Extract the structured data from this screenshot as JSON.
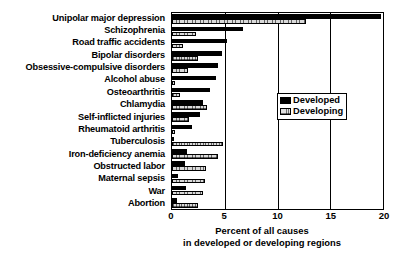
{
  "chart_data": {
    "type": "bar",
    "orientation": "horizontal",
    "title": "",
    "xlabel_line1": "Percent of all causes",
    "xlabel_line2": "in developed or developing regions",
    "ylabel": "",
    "xlim": [
      0,
      20
    ],
    "xticks": [
      0,
      5,
      10,
      15,
      20
    ],
    "grid": true,
    "legend_position": "right",
    "categories": [
      "Unipolar major depression",
      "Schizophrenia",
      "Road traffic accidents",
      "Bipolar disorders",
      "Obsessive-compulsive disorders",
      "Alcohol abuse",
      "Osteoarthritis",
      "Chlamydia",
      "Self-inflicted injuries",
      "Rheumatoid arthritis",
      "Tuberculosis",
      "Iron-deficiency anemia",
      "Obstructed labor",
      "Maternal sepsis",
      "War",
      "Abortion"
    ],
    "series": [
      {
        "name": "Developed",
        "color": "#000000",
        "values": [
          19.8,
          6.7,
          5.2,
          4.7,
          4.4,
          4.2,
          3.6,
          2.9,
          2.7,
          1.9,
          0.2,
          1.4,
          1.2,
          0.6,
          1.3,
          0.5
        ]
      },
      {
        "name": "Developing",
        "color": "#d9d9d9",
        "values": [
          12.7,
          2.3,
          1.0,
          2.5,
          1.5,
          0.3,
          0.8,
          3.3,
          1.6,
          0.3,
          4.8,
          4.4,
          3.2,
          3.1,
          2.9,
          2.5
        ]
      }
    ]
  },
  "legend": {
    "items": [
      {
        "label": "Developed",
        "swatch": "solid-black-swatch"
      },
      {
        "label": "Developing",
        "swatch": "hatched-gray-swatch"
      }
    ]
  },
  "axis": {
    "tick_labels": [
      "0",
      "5",
      "10",
      "15",
      "20"
    ],
    "title_line1": "Percent of all causes",
    "title_line2": "in developed or developing regions"
  }
}
